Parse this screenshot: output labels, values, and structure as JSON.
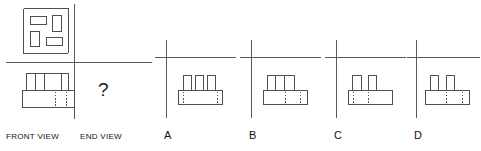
{
  "question": {
    "type": "orthographic-projection-multiple-choice",
    "prompt_symbol": "?",
    "given_views": [
      {
        "id": "plan-view",
        "label": "",
        "position": "top-left",
        "description": "plan view: square outline containing four small rectangles"
      },
      {
        "id": "front-view",
        "label": "FRONT VIEW",
        "position": "bottom-left",
        "description": "pictorial of a base slab with three raised prisms on top"
      }
    ],
    "missing_view": {
      "id": "end-view",
      "label": "END VIEW",
      "marker": "?"
    }
  },
  "labels": {
    "front_view": "FRONT VIEW",
    "end_view": "END VIEW",
    "question_mark": "?"
  },
  "options": [
    {
      "letter": "A",
      "description": "base slab with three narrow tall prisms, evenly spaced, hidden dashed lines at both ends"
    },
    {
      "letter": "B",
      "description": "base slab with a single wide raised block on the left half, hidden dashed lines right of centre"
    },
    {
      "letter": "C",
      "description": "base slab with two tall prisms at left and centre, hidden dashed lines at left and centre"
    },
    {
      "letter": "D",
      "description": "base slab with two tall prisms, hidden dashed lines at centre and right"
    }
  ],
  "colors": {
    "line": "#4f4f4f",
    "axis": "#5a5a5a",
    "hidden_line": "#555555",
    "text": "#111111",
    "background": "#ffffff"
  },
  "plan_view": {
    "outer_square": "rounded square border",
    "inner_rectangles": [
      {
        "id": "rect-top-left",
        "orientation": "horizontal"
      },
      {
        "id": "rect-top-right",
        "orientation": "vertical"
      },
      {
        "id": "rect-bottom-left",
        "orientation": "vertical"
      },
      {
        "id": "rect-bottom-right",
        "orientation": "horizontal"
      }
    ]
  }
}
